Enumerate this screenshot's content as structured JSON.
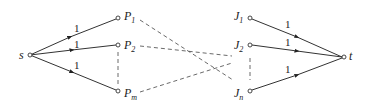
{
  "diagram": {
    "type": "flow-network",
    "nodes": {
      "s": {
        "label": "s",
        "x": 30,
        "y": 55
      },
      "P1": {
        "label": "P",
        "sub": "1",
        "x": 118,
        "y": 18
      },
      "P2": {
        "label": "P",
        "sub": "2",
        "x": 118,
        "y": 45
      },
      "Pm": {
        "label": "P",
        "sub": "m",
        "x": 118,
        "y": 91
      },
      "J1": {
        "label": "J",
        "sub": "1",
        "x": 250,
        "y": 18
      },
      "J2": {
        "label": "J",
        "sub": "2",
        "x": 250,
        "y": 45
      },
      "Jn": {
        "label": "J",
        "sub": "n",
        "x": 250,
        "y": 91
      },
      "t": {
        "label": "t",
        "x": 344,
        "y": 57
      }
    },
    "edges": [
      {
        "from": "s",
        "to": "P1",
        "weight": "1"
      },
      {
        "from": "s",
        "to": "P2",
        "weight": "1"
      },
      {
        "from": "s",
        "to": "Pm",
        "weight": "1"
      },
      {
        "from": "J1",
        "to": "t",
        "weight": "1"
      },
      {
        "from": "J2",
        "to": "t",
        "weight": "1"
      },
      {
        "from": "Jn",
        "to": "t",
        "weight": "1"
      }
    ],
    "dashed": [
      "P1-J side",
      "P2-J side",
      "Pm-J side",
      "P2..Pm ellipsis",
      "J2..Jn ellipsis"
    ]
  }
}
